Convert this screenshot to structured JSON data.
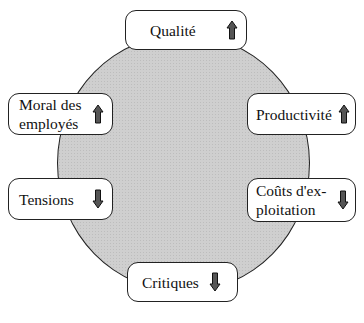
{
  "diagram": {
    "center": {
      "shape": "circle",
      "fill": "#cfcfcf"
    },
    "items": [
      {
        "id": "qualite",
        "label": "Qualité",
        "direction": "up",
        "icon": "arrow-up-icon"
      },
      {
        "id": "moral",
        "label": "Moral des employés",
        "line1": "Moral des",
        "line2": "employés",
        "direction": "up",
        "icon": "arrow-up-icon"
      },
      {
        "id": "productivite",
        "label": "Productivité",
        "direction": "up",
        "icon": "arrow-up-icon"
      },
      {
        "id": "tensions",
        "label": "Tensions",
        "direction": "down",
        "icon": "arrow-down-icon"
      },
      {
        "id": "couts",
        "label": "Coûts d'exploitation",
        "line1": "Coûts d'ex-",
        "line2": "ploitation",
        "direction": "down",
        "icon": "arrow-down-icon"
      },
      {
        "id": "critiques",
        "label": "Critiques",
        "direction": "down",
        "icon": "arrow-down-icon"
      }
    ],
    "colors": {
      "arrow_fill": "#555555",
      "border": "#222222"
    }
  }
}
